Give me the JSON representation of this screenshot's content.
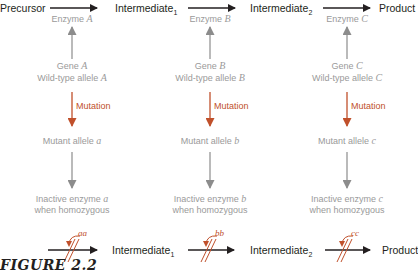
{
  "figure_caption": "FIGURE 2.2",
  "pathway": {
    "nodes": [
      {
        "label": "Precursor",
        "sub": ""
      },
      {
        "label": "Intermediate",
        "sub": "1"
      },
      {
        "label": "Intermediate",
        "sub": "2"
      },
      {
        "label": "Product",
        "sub": ""
      }
    ]
  },
  "columns": [
    {
      "enzyme_prefix": "Enzyme ",
      "enzyme_letter": "A",
      "gene_prefix": "Gene ",
      "gene_letter": "A",
      "wild_prefix": "Wild-type allele ",
      "wild_letter": "A",
      "mutation_label": "Mutation",
      "mutant_prefix": "Mutant allele ",
      "mutant_letter": "a",
      "inactive_prefix": "Inactive enzyme ",
      "inactive_letter": "a",
      "inactive_line2": "when homozygous",
      "genotype": "aa"
    },
    {
      "enzyme_prefix": "Enzyme ",
      "enzyme_letter": "B",
      "gene_prefix": "Gene ",
      "gene_letter": "B",
      "wild_prefix": "Wild-type allele ",
      "wild_letter": "B",
      "mutation_label": "Mutation",
      "mutant_prefix": "Mutant allele ",
      "mutant_letter": "b",
      "inactive_prefix": "Inactive enzyme ",
      "inactive_letter": "b",
      "inactive_line2": "when homozygous",
      "genotype": "bb"
    },
    {
      "enzyme_prefix": "Enzyme ",
      "enzyme_letter": "C",
      "gene_prefix": "Gene ",
      "gene_letter": "C",
      "wild_prefix": "Wild-type allele ",
      "wild_letter": "C",
      "mutation_label": "Mutation",
      "mutant_prefix": "Mutant allele ",
      "mutant_letter": "c",
      "inactive_prefix": "Inactive enzyme ",
      "inactive_letter": "c",
      "inactive_line2": "when homozygous",
      "genotype": "cc"
    }
  ],
  "blocked_pathway": {
    "nodes": [
      {
        "label": "Intermediate",
        "sub": "1"
      },
      {
        "label": "Intermediate",
        "sub": "2"
      },
      {
        "label": "Product",
        "sub": ""
      }
    ]
  },
  "colors": {
    "main_text": "#231f20",
    "gray_text": "#9a9a9a",
    "gray_arrow": "#8c8c8c",
    "mutation": "#c0502b"
  }
}
